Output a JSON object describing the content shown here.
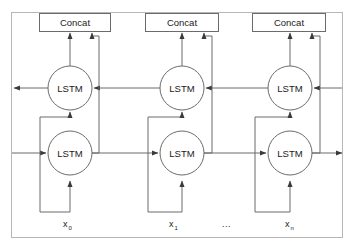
{
  "figure": {
    "background_color": "#ffffff",
    "line_color": "#6b6b6b",
    "text_color": "#1a1a1a",
    "frame": {
      "x": 11,
      "y": 12,
      "width": 332,
      "height": 226
    }
  },
  "concat_boxes": [
    {
      "label": "Concat",
      "x": 39,
      "y": 13,
      "width": 71,
      "height": 18
    },
    {
      "label": "Concat",
      "x": 145,
      "y": 13,
      "width": 73,
      "height": 18
    },
    {
      "label": "Concat",
      "x": 252,
      "y": 13,
      "width": 73,
      "height": 18
    }
  ],
  "backward_cells": [
    {
      "label": "LSTM",
      "cx": 70,
      "cy": 88,
      "r": 22
    },
    {
      "label": "LSTM",
      "cx": 182,
      "cy": 88,
      "r": 22
    },
    {
      "label": "LSTM",
      "cx": 290,
      "cy": 88,
      "r": 22
    }
  ],
  "forward_cells": [
    {
      "label": "LSTM",
      "cx": 70,
      "cy": 153,
      "r": 22
    },
    {
      "label": "LSTM",
      "cx": 182,
      "cy": 153,
      "r": 22
    },
    {
      "label": "LSTM",
      "cx": 290,
      "cy": 153,
      "r": 22
    }
  ],
  "input_labels": [
    {
      "base": "x",
      "sub": "0",
      "x": 62,
      "y": 227
    },
    {
      "base": "x",
      "sub": "1",
      "x": 168,
      "y": 227
    },
    {
      "base": "x",
      "sub": "n",
      "x": 285,
      "y": 227
    }
  ],
  "ellipsis": {
    "text": "...",
    "x": 222,
    "y": 227
  },
  "legend": {
    "forward_direction": "left-to-right",
    "backward_direction": "right-to-left",
    "cell_type": "LSTM",
    "merge_mode": "Concat"
  }
}
